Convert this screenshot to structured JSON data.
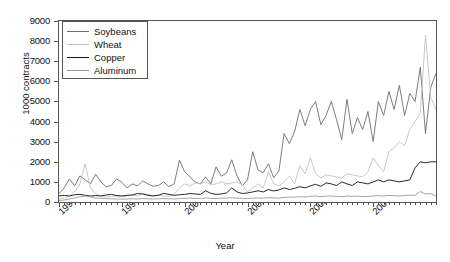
{
  "chart_data": {
    "type": "line",
    "title": "",
    "xlabel": "Year",
    "ylabel": "1000 contracts",
    "ylim": [
      0,
      9000
    ],
    "ytick_values": [
      0,
      1000,
      2000,
      3000,
      4000,
      5000,
      6000,
      7000,
      8000,
      9000
    ],
    "ytick_labels": [
      "0",
      "1000",
      "2000",
      "3000",
      "4000",
      "5000",
      "6000",
      "7000",
      "8000",
      "9000"
    ],
    "xlim": [
      1998.0,
      2004.0
    ],
    "xtick_values": [
      1998,
      1999,
      2000,
      2001,
      2002,
      2003
    ],
    "xtick_labels": [
      "1998",
      "1999",
      "2000",
      "2001",
      "2002",
      "2003"
    ],
    "minor_xticks_per_year": 12,
    "grid": false,
    "legend_position": "upper-left",
    "x": [
      1998.0,
      1998.083,
      1998.167,
      1998.25,
      1998.333,
      1998.417,
      1998.5,
      1998.583,
      1998.667,
      1998.75,
      1998.833,
      1998.917,
      1999.0,
      1999.083,
      1999.167,
      1999.25,
      1999.333,
      1999.417,
      1999.5,
      1999.583,
      1999.667,
      1999.75,
      1999.833,
      1999.917,
      2000.0,
      2000.083,
      2000.167,
      2000.25,
      2000.333,
      2000.417,
      2000.5,
      2000.583,
      2000.667,
      2000.75,
      2000.833,
      2000.917,
      2001.0,
      2001.083,
      2001.167,
      2001.25,
      2001.333,
      2001.417,
      2001.5,
      2001.583,
      2001.667,
      2001.75,
      2001.833,
      2001.917,
      2002.0,
      2002.083,
      2002.167,
      2002.25,
      2002.333,
      2002.417,
      2002.5,
      2002.583,
      2002.667,
      2002.75,
      2002.833,
      2002.917,
      2003.0,
      2003.083,
      2003.167,
      2003.25,
      2003.333,
      2003.417,
      2003.5,
      2003.583,
      2003.667,
      2003.75,
      2003.833,
      2003.917,
      2004.0
    ],
    "series": [
      {
        "name": "Soybeans",
        "color": "#6e6e6e",
        "values": [
          420,
          700,
          1150,
          800,
          1300,
          1100,
          900,
          1380,
          1000,
          760,
          820,
          1150,
          980,
          700,
          900,
          800,
          1050,
          900,
          780,
          820,
          1000,
          760,
          900,
          2080,
          1500,
          1250,
          1000,
          900,
          1250,
          900,
          1750,
          1280,
          1450,
          2100,
          1300,
          800,
          1100,
          2500,
          1600,
          1450,
          1900,
          1200,
          1550,
          3400,
          2900,
          3500,
          4600,
          3800,
          4600,
          5000,
          3850,
          4300,
          5000,
          4100,
          3100,
          5100,
          3400,
          4200,
          3600,
          4500,
          3000,
          5000,
          4300,
          5500,
          4600,
          5800,
          4300,
          5400,
          5000,
          6700,
          3400,
          5700,
          6400
        ]
      },
      {
        "name": "Wheat",
        "color": "#c2c2c2",
        "values": [
          150,
          200,
          300,
          500,
          900,
          1900,
          700,
          400,
          300,
          250,
          280,
          300,
          250,
          300,
          350,
          300,
          420,
          380,
          300,
          340,
          300,
          280,
          400,
          700,
          900,
          800,
          950,
          900,
          1000,
          850,
          900,
          1000,
          900,
          950,
          1000,
          850,
          500,
          700,
          900,
          700,
          1500,
          900,
          800,
          1000,
          1300,
          900,
          1800,
          1400,
          2200,
          1400,
          1200,
          1350,
          1300,
          1250,
          1200,
          1400,
          1350,
          1300,
          1250,
          1500,
          2200,
          1800,
          1500,
          2500,
          2700,
          3000,
          2800,
          3600,
          4000,
          4400,
          8300,
          5200,
          4600
        ]
      },
      {
        "name": "Copper",
        "color": "#111111",
        "values": [
          300,
          330,
          300,
          360,
          380,
          330,
          300,
          320,
          300,
          350,
          380,
          320,
          300,
          330,
          350,
          420,
          400,
          330,
          300,
          340,
          430,
          380,
          330,
          360,
          380,
          420,
          400,
          380,
          560,
          430,
          380,
          400,
          450,
          700,
          500,
          420,
          450,
          500,
          560,
          500,
          620,
          550,
          600,
          700,
          620,
          680,
          760,
          700,
          800,
          880,
          780,
          950,
          900,
          820,
          1000,
          900,
          820,
          1000,
          950,
          900,
          1000,
          1100,
          1000,
          1100,
          1050,
          1000,
          1050,
          1100,
          1700,
          2000,
          1950,
          2000,
          2000
        ]
      },
      {
        "name": "Aluminum",
        "color": "#9a9a9a",
        "values": [
          80,
          100,
          150,
          200,
          260,
          300,
          250,
          200,
          180,
          170,
          160,
          150,
          140,
          150,
          160,
          150,
          170,
          160,
          150,
          160,
          170,
          160,
          150,
          170,
          180,
          190,
          180,
          170,
          200,
          180,
          170,
          190,
          200,
          210,
          190,
          180,
          170,
          190,
          200,
          190,
          220,
          200,
          190,
          230,
          250,
          240,
          260,
          250,
          280,
          300,
          270,
          290,
          300,
          280,
          260,
          300,
          280,
          290,
          270,
          280,
          300,
          320,
          300,
          330,
          310,
          300,
          320,
          340,
          330,
          520,
          400,
          420,
          300
        ]
      }
    ]
  },
  "legend": {
    "items": [
      {
        "label": "Soybeans",
        "color": "#6e6e6e"
      },
      {
        "label": "Wheat",
        "color": "#c2c2c2"
      },
      {
        "label": "Copper",
        "color": "#111111"
      },
      {
        "label": "Aluminum",
        "color": "#9a9a9a"
      }
    ]
  }
}
